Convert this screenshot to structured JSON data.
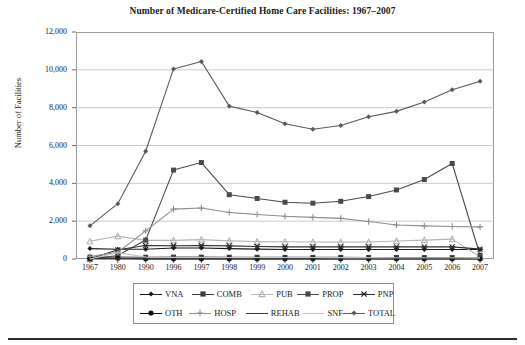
{
  "chart_data": {
    "type": "line",
    "title": "Number of Medicare-Certified Home Care Facilities: 1967–2007",
    "xlabel": "",
    "ylabel": "Number of Facilities",
    "ylim": [
      0,
      12000
    ],
    "ytick_labels": [
      "12,000",
      "10,000",
      "8,000",
      "6,000",
      "4,000",
      "2,000",
      "0"
    ],
    "ytick_values": [
      12000,
      10000,
      8000,
      6000,
      4000,
      2000,
      0
    ],
    "grid": "horizontal",
    "legend_position": "bottom",
    "categories": [
      "1967",
      "1980",
      "1990",
      "1996",
      "1997",
      "1998",
      "1999",
      "2000",
      "2001",
      "2002",
      "2003",
      "2004",
      "2005",
      "2006",
      "2007"
    ],
    "series": [
      {
        "name": "VNA",
        "color": "#1a1a1a",
        "marker": "diamond",
        "values": [
          550,
          515,
          515,
          580,
          585,
          550,
          520,
          500,
          500,
          500,
          500,
          500,
          500,
          500,
          505
        ]
      },
      {
        "name": "COMB",
        "color": "#3d3d3d",
        "marker": "square",
        "values": [
          95,
          105,
          95,
          100,
          100,
          95,
          90,
          85,
          85,
          85,
          80,
          80,
          75,
          75,
          70
        ]
      },
      {
        "name": "PUB",
        "color": "#b5b5b5",
        "marker": "triangle",
        "values": [
          940,
          1210,
          985,
          985,
          1025,
          960,
          920,
          910,
          900,
          890,
          900,
          950,
          1000,
          1050,
          120
        ]
      },
      {
        "name": "PROP",
        "color": "#4a4a4a",
        "marker": "square",
        "values": [
          0,
          185,
          1000,
          4700,
          5100,
          3400,
          3200,
          3000,
          2950,
          3050,
          3300,
          3650,
          4200,
          5050,
          200
        ]
      },
      {
        "name": "PNP",
        "color": "#2e2e2e",
        "marker": "cross",
        "values": [
          0,
          485,
          710,
          700,
          715,
          695,
          660,
          640,
          640,
          640,
          640,
          640,
          640,
          640,
          520
        ]
      },
      {
        "name": "OTH",
        "color": "#111111",
        "marker": "circle",
        "values": [
          39,
          40,
          0,
          0,
          0,
          0,
          0,
          0,
          0,
          0,
          0,
          0,
          0,
          0,
          0
        ]
      },
      {
        "name": "HOSP",
        "color": "#8e8e8e",
        "marker": "plus",
        "values": [
          133,
          359,
          1486,
          2634,
          2698,
          2462,
          2356,
          2260,
          2200,
          2150,
          1980,
          1800,
          1750,
          1720,
          1700
        ]
      },
      {
        "name": "REHAB",
        "color": "#3a3a3a",
        "marker": "none",
        "values": [
          0,
          9,
          8,
          4,
          3,
          3,
          2,
          2,
          1,
          1,
          1,
          1,
          1,
          1,
          1
        ]
      },
      {
        "name": "SNF",
        "color": "#c4c4c4",
        "marker": "none",
        "values": [
          0,
          336,
          101,
          87,
          85,
          83,
          80,
          78,
          76,
          74,
          72,
          70,
          68,
          66,
          60
        ]
      },
      {
        "name": "TOTAL",
        "color": "#5a5a5a",
        "marker": "diamond",
        "values": [
          1753,
          2924,
          5695,
          10047,
          10444,
          8080,
          7747,
          7152,
          6861,
          7057,
          7519,
          7804,
          8304,
          8944,
          9396
        ]
      }
    ]
  },
  "legend": {
    "row1": [
      {
        "label": "VNA",
        "marker": "diamond",
        "color": "#1a1a1a"
      },
      {
        "label": "COMB",
        "marker": "square",
        "color": "#3d3d3d"
      },
      {
        "label": "PUB",
        "marker": "triangle",
        "color": "#b5b5b5"
      },
      {
        "label": "PROP",
        "marker": "square",
        "color": "#4a4a4a"
      },
      {
        "label": "PNP",
        "marker": "cross",
        "color": "#2e2e2e"
      }
    ],
    "row2": [
      {
        "label": "OTH",
        "marker": "circle",
        "color": "#111111"
      },
      {
        "label": "HOSP",
        "marker": "plus",
        "color": "#8e8e8e"
      },
      {
        "label": "REHAB",
        "marker": "none",
        "color": "#3a3a3a"
      },
      {
        "label": "SNF",
        "marker": "none",
        "color": "#c4c4c4"
      },
      {
        "label": "TOTAL",
        "marker": "diamond",
        "color": "#5a5a5a"
      }
    ]
  }
}
